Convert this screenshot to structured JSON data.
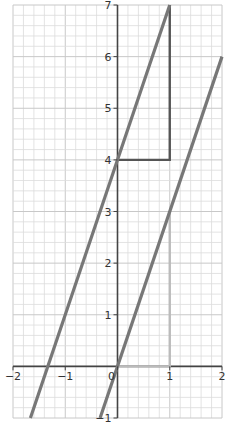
{
  "chart_data": {
    "type": "line",
    "title": "",
    "xlabel": "",
    "ylabel": "",
    "xlim": [
      -2,
      2
    ],
    "ylim": [
      -1,
      7
    ],
    "grid": true,
    "grid_minor_step": 0.2,
    "x_ticks": [
      "-2",
      "-1",
      "0",
      "1",
      "2"
    ],
    "y_ticks": [
      "-1",
      "1",
      "2",
      "3",
      "4",
      "5",
      "6",
      "7"
    ],
    "series": [
      {
        "name": "y = 3x + 4",
        "slope": 3,
        "intercept": 4,
        "color": "#777777"
      },
      {
        "name": "y = 3x",
        "slope": 3,
        "intercept": 0,
        "color": "#777777"
      }
    ],
    "annotations": [
      {
        "type": "slope-triangle",
        "points": [
          [
            0,
            4
          ],
          [
            1,
            4
          ],
          [
            1,
            7
          ]
        ],
        "color": "#555555"
      },
      {
        "type": "slope-triangle",
        "points": [
          [
            0,
            0
          ],
          [
            1,
            0
          ],
          [
            1,
            3
          ]
        ],
        "color": "#bbbbbb"
      }
    ]
  }
}
